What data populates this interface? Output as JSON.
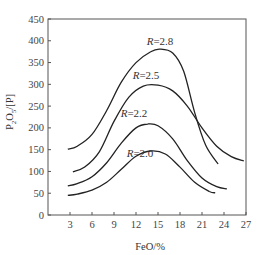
{
  "chart_data": {
    "type": "line",
    "title": "",
    "xlabel": "FeO/%",
    "ylabel": "P2O5/[P]",
    "xlim": [
      0,
      27
    ],
    "ylim": [
      0,
      450
    ],
    "xticks": [
      3,
      6,
      9,
      12,
      15,
      18,
      21,
      24,
      27
    ],
    "yticks": [
      0,
      50,
      100,
      150,
      200,
      250,
      300,
      350,
      400,
      450
    ],
    "grid": false,
    "legend": "inline labels",
    "series": [
      {
        "name": "R=2.8",
        "x": [
          2.7,
          4,
          6,
          8,
          10,
          12,
          14,
          15.3,
          17,
          18.5,
          20,
          21.5,
          23.2
        ],
        "y": [
          151,
          158,
          185,
          240,
          305,
          350,
          375,
          381,
          372,
          330,
          235,
          160,
          117
        ]
      },
      {
        "name": "R=2.5",
        "x": [
          3.4,
          5,
          7,
          9,
          11,
          13,
          15,
          17,
          19,
          21,
          23,
          25,
          26.7
        ],
        "y": [
          99,
          110,
          145,
          215,
          270,
          296,
          298,
          285,
          250,
          200,
          158,
          134,
          124
        ]
      },
      {
        "name": "R=2.2",
        "x": [
          2.7,
          4,
          6,
          8,
          10,
          12,
          13.6,
          15,
          17,
          19,
          21,
          23,
          24.4
        ],
        "y": [
          67,
          72,
          88,
          120,
          165,
          200,
          209,
          205,
          175,
          125,
          85,
          65,
          60
        ]
      },
      {
        "name": "R=2.0",
        "x": [
          2.7,
          4,
          6,
          8,
          10,
          12,
          14,
          16,
          18,
          20,
          22,
          22.8
        ],
        "y": [
          45,
          48,
          57,
          75,
          105,
          135,
          147,
          140,
          110,
          75,
          54,
          51
        ]
      }
    ]
  },
  "labels": {
    "xlabel": "FeO/%",
    "ylabel_main": "P",
    "ylabel_sub1": "2",
    "ylabel_mid": "O",
    "ylabel_sub2": "5",
    "ylabel_tail": "/[P]",
    "curves": [
      {
        "R": "R",
        "eq": "=2.8"
      },
      {
        "R": "R",
        "eq": "=2.5"
      },
      {
        "R": "R",
        "eq": "=2.2"
      },
      {
        "R": "R",
        "eq": "=2.0"
      }
    ]
  }
}
